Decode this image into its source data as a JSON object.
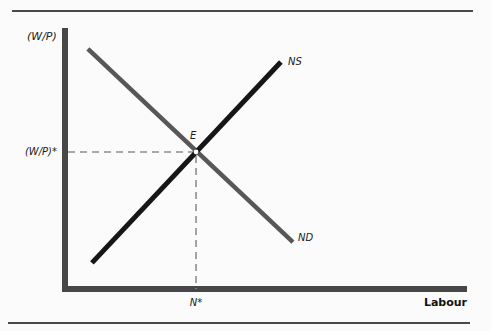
{
  "colors": {
    "background": "#fbfbfb",
    "axis": "#474747",
    "rule": "#4a4a4a",
    "supply_line": "#161616",
    "demand_line": "#575757",
    "guide_dash": "#8f8f8f"
  },
  "chart_data": {
    "type": "line",
    "title": "",
    "xlabel": "Labour",
    "ylabel": "(W/P)",
    "grid": false,
    "axes_numeric": false,
    "series": [
      {
        "name": "ND",
        "role": "labour-demand",
        "slope": "downward",
        "color": "#575757",
        "stroke_width": 4.5,
        "points_norm": [
          [
            0.057,
            0.92
          ],
          [
            0.567,
            0.18
          ]
        ]
      },
      {
        "name": "NS",
        "role": "labour-supply",
        "slope": "upward",
        "color": "#161616",
        "stroke_width": 5,
        "points_norm": [
          [
            0.067,
            0.1
          ],
          [
            0.537,
            0.87
          ]
        ]
      }
    ],
    "equilibrium": {
      "label": "E",
      "x_norm": 0.326,
      "y_norm": 0.525,
      "x_tick_label": "N*",
      "y_tick_label": "(W/P)*",
      "marker": "open-white-dot"
    },
    "guides": {
      "style": "dashed",
      "color": "#8f8f8f",
      "width": 1.6,
      "dash_pattern": "7 5",
      "lines": [
        "horizontal-from-y-axis-to-E",
        "vertical-from-E-to-x-axis"
      ]
    }
  }
}
